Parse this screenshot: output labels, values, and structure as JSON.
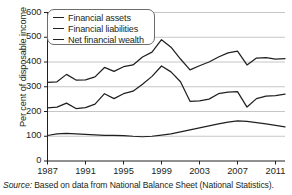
{
  "figure": {
    "source_prefix": "Source:",
    "source_text": " Based on data from National Balance Sheet (National Statistics)."
  },
  "chart_data": {
    "type": "line",
    "title": "",
    "xlabel": "",
    "ylabel": "Per cent of disposable income",
    "xlim": [
      1987,
      2012
    ],
    "ylim": [
      0,
      600
    ],
    "grid": true,
    "legend_position": "top-left",
    "ytick_labels": [
      "0",
      "100",
      "200",
      "300",
      "400",
      "500",
      "600"
    ],
    "ytick_values": [
      0,
      100,
      200,
      300,
      400,
      500,
      600
    ],
    "xtick_labels": [
      "1987",
      "1991",
      "1995",
      "1999",
      "2003",
      "2007",
      "2011"
    ],
    "xtick_values": [
      1987,
      1991,
      1995,
      1999,
      2003,
      2007,
      2011
    ],
    "x": [
      1987,
      1988,
      1989,
      1990,
      1991,
      1992,
      1993,
      1994,
      1995,
      1996,
      1997,
      1998,
      1999,
      2000,
      2001,
      2002,
      2003,
      2004,
      2005,
      2006,
      2007,
      2008,
      2009,
      2010,
      2011,
      2012
    ],
    "series": [
      {
        "name": "Financial assets",
        "color": "#231f20",
        "values": [
          318,
          320,
          350,
          327,
          328,
          340,
          378,
          362,
          381,
          388,
          420,
          440,
          490,
          460,
          412,
          368,
          385,
          400,
          420,
          437,
          444,
          388,
          416,
          418,
          412,
          414
        ]
      },
      {
        "name": "Financial liabilities",
        "color": "#231f20",
        "values": [
          215,
          218,
          234,
          212,
          216,
          230,
          272,
          252,
          272,
          282,
          310,
          342,
          384,
          360,
          320,
          241,
          243,
          250,
          272,
          278,
          280,
          218,
          252,
          262,
          264,
          270
        ]
      },
      {
        "name": "Net financial wealth",
        "color": "#231f20",
        "values": [
          103,
          110,
          112,
          110,
          108,
          106,
          104,
          104,
          103,
          100,
          98,
          100,
          105,
          110,
          118,
          126,
          134,
          142,
          150,
          157,
          162,
          160,
          155,
          150,
          144,
          138
        ]
      }
    ]
  }
}
